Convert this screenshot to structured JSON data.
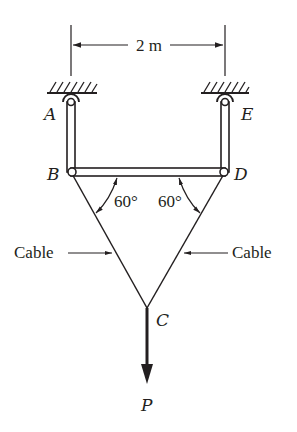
{
  "figure": {
    "dimension": {
      "label": "2 m"
    },
    "points": {
      "A": "A",
      "B": "B",
      "C": "C",
      "D": "D",
      "E": "E"
    },
    "angles": {
      "left": "60°",
      "right": "60°"
    },
    "cable_labels": {
      "left": "Cable",
      "right": "Cable"
    },
    "load": {
      "label": "P"
    },
    "colors": {
      "ink": "#231f20",
      "background": "#ffffff"
    }
  }
}
